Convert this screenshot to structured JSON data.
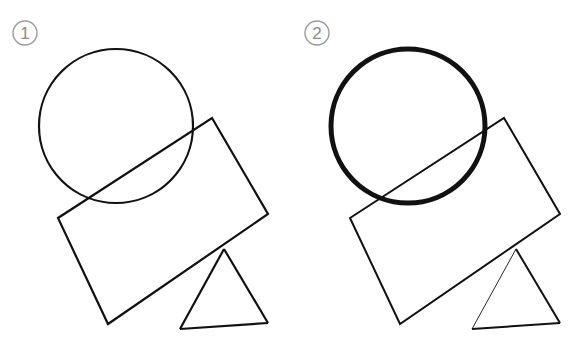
{
  "canvas": {
    "width": 585,
    "height": 337,
    "background_color": "#ffffff",
    "stroke_color": "#111111",
    "badge_color": "#9a9a9a"
  },
  "panels": [
    {
      "id": "panel-1",
      "badge_number": "1",
      "badge": {
        "cx": 25,
        "cy": 33,
        "r": 12,
        "stroke_width": 1.4
      },
      "shapes": {
        "circle": {
          "name": "circle",
          "cx": 116,
          "cy": 126,
          "r": 77,
          "stroke_width": 2.2,
          "fill": "none"
        },
        "rectangle": {
          "name": "rectangle",
          "points": "212,118 268,214 108,324 58,218",
          "stroke_width": 2.2,
          "fill": "none"
        },
        "triangle": {
          "name": "triangle",
          "points": "224,249 268,323 180,329",
          "stroke_width": 2.2,
          "fill": "none",
          "left_edge_stroke_width": 2.2
        }
      }
    },
    {
      "id": "panel-2",
      "badge_number": "2",
      "badge": {
        "cx": 25,
        "cy": 33,
        "r": 12,
        "stroke_width": 1.4
      },
      "shapes": {
        "circle": {
          "name": "circle",
          "cx": 116,
          "cy": 126,
          "r": 77,
          "stroke_width": 5.0,
          "fill": "none"
        },
        "rectangle": {
          "name": "rectangle",
          "points": "212,118 268,214 108,324 58,218",
          "stroke_width": 2.0,
          "fill": "none"
        },
        "triangle": {
          "name": "triangle",
          "points": "224,249 268,323 180,329",
          "stroke_width": 2.0,
          "fill": "none",
          "left_edge_stroke_width": 0.9
        }
      }
    }
  ]
}
